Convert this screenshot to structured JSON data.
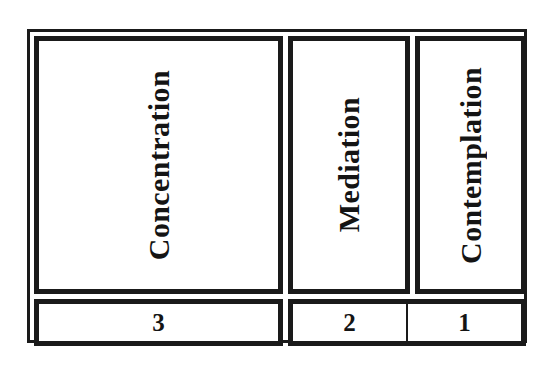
{
  "diagram": {
    "type": "hierarchy-table",
    "colors": {
      "border": "#1a1a1a",
      "text": "#141414",
      "background": "#ffffff"
    },
    "stages": [
      {
        "label": "Concentration",
        "rank": "3"
      },
      {
        "label": "Mediation",
        "rank": "2"
      },
      {
        "label": "Contemplation",
        "rank": "1"
      }
    ]
  }
}
